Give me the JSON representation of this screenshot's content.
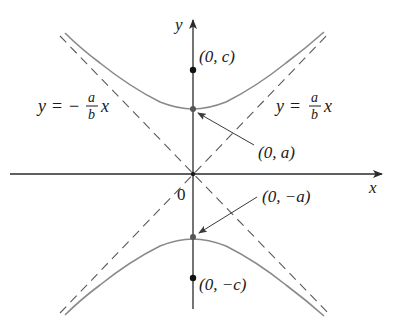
{
  "figure": {
    "axes": {
      "x_label": "x",
      "y_label": "y",
      "origin_label": "0"
    },
    "points": {
      "focus_top": "(0, c)",
      "vertex_top": "(0, a)",
      "vertex_bottom": "(0, −a)",
      "focus_bottom": "(0, −c)"
    },
    "asymptotes": {
      "positive": {
        "lhs": "y",
        "eq": "=",
        "num": "a",
        "den": "b",
        "var": "x"
      },
      "negative": {
        "lhs": "y",
        "eq": "=",
        "sign": "−",
        "num": "a",
        "den": "b",
        "var": "x"
      }
    },
    "colors": {
      "curve": "#8a8a8a",
      "axis": "#2a2a2a",
      "asymptote": "#5a5a5a",
      "text": "#1a1a1a"
    }
  }
}
